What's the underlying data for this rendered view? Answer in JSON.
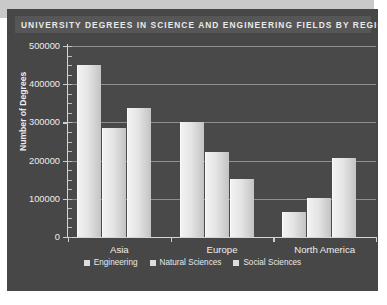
{
  "chart_data": {
    "type": "bar",
    "title": "UNIVERSITY DEGREES IN SCIENCE AND ENGINEERING FIELDS BY REGION (2000)",
    "xlabel": "",
    "ylabel": "Number of Degrees",
    "categories": [
      "Asia",
      "Europe",
      "North America"
    ],
    "series": [
      {
        "name": "Engineering",
        "values": [
          450000,
          300000,
          65000
        ]
      },
      {
        "name": "Natural Sciences",
        "values": [
          285000,
          222000,
          103000
        ]
      },
      {
        "name": "Social Sciences",
        "values": [
          337000,
          152000,
          208000
        ]
      }
    ],
    "ylim": [
      0,
      500000
    ],
    "ytick_values": [
      0,
      100000,
      200000,
      300000,
      400000,
      500000
    ],
    "ytick_labels": [
      "0",
      "100000",
      "200000",
      "300000",
      "400000",
      "500000"
    ],
    "grid": true,
    "legend_position": "bottom",
    "colors": {
      "panel_background": "#474747",
      "plot_background": "#494949",
      "title_band": "#565656",
      "title_text": "#e9e9e9",
      "gridline": "#8f8f8f",
      "axis": "#d6d6d6",
      "tick_text": "#ececec",
      "bar_light": "#f2f2f2",
      "bar_dark": "#c3c3c3",
      "page_background": "#ffffff",
      "bevel": "#c9c9c9"
    }
  },
  "legend": {
    "items": [
      {
        "label": "Engineering",
        "swatch_name": "legend-swatch-engineering"
      },
      {
        "label": "Natural Sciences",
        "swatch_name": "legend-swatch-natural-sciences"
      },
      {
        "label": "Social Sciences",
        "swatch_name": "legend-swatch-social-sciences"
      }
    ]
  }
}
